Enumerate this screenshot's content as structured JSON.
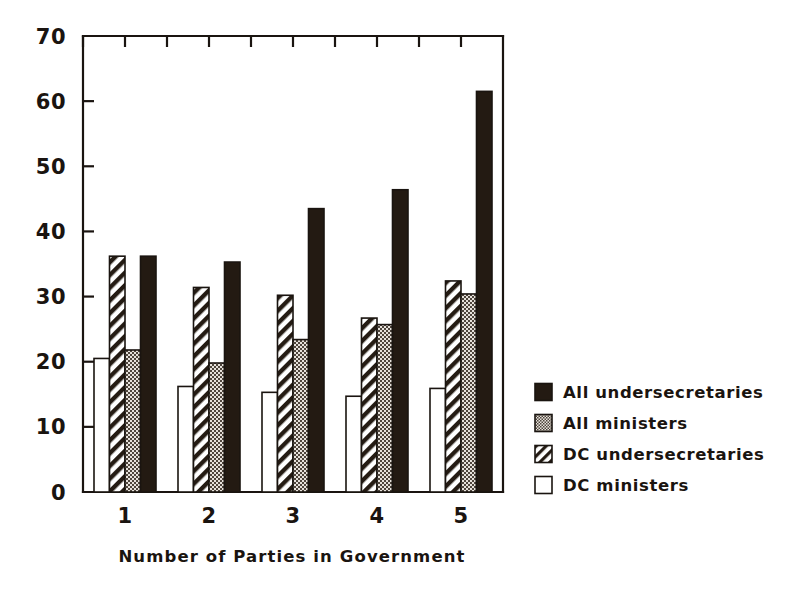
{
  "chart_data": {
    "type": "bar",
    "title": "",
    "xlabel": "Number of Parties in Government",
    "ylabel": "",
    "categories": [
      "1",
      "2",
      "3",
      "4",
      "5"
    ],
    "xtick_labels": [
      "1",
      "2",
      "3",
      "4",
      "5"
    ],
    "ytick_labels": [
      "0",
      "10",
      "20",
      "30",
      "40",
      "50",
      "60",
      "70"
    ],
    "ytick_values": [
      0,
      10,
      20,
      30,
      40,
      50,
      60,
      70
    ],
    "ylim": [
      0,
      70
    ],
    "grid": false,
    "legend_position": "right",
    "series": [
      {
        "name": "All undersecretaries",
        "fill": "solid-black",
        "color": "#231a12",
        "values": [
          36.2,
          35.3,
          43.5,
          46.4,
          61.5
        ]
      },
      {
        "name": "All ministers",
        "fill": "fine-stipple",
        "color": "#b8b0a8",
        "values": [
          21.8,
          19.8,
          23.4,
          25.7,
          30.4
        ]
      },
      {
        "name": "DC undersecretaries",
        "fill": "diagonal-hatch",
        "color": "#ffffff",
        "values": [
          36.2,
          31.4,
          30.2,
          26.7,
          32.4
        ]
      },
      {
        "name": "DC ministers",
        "fill": "white",
        "color": "#ffffff",
        "values": [
          20.5,
          16.2,
          15.3,
          14.7,
          15.9
        ]
      }
    ],
    "bar_draw_order": [
      "DC ministers",
      "DC undersecretaries",
      "All ministers",
      "All undersecretaries"
    ],
    "legend": [
      {
        "label": "All undersecretaries",
        "fill": "solid-black"
      },
      {
        "label": "All ministers",
        "fill": "fine-stipple"
      },
      {
        "label": "DC undersecretaries",
        "fill": "diagonal-hatch"
      },
      {
        "label": "DC ministers",
        "fill": "white"
      }
    ]
  },
  "colors": {
    "ink": "#1a1410",
    "black_bar": "#231a12",
    "gray_bar": "#b5ada4",
    "background": "#ffffff"
  }
}
